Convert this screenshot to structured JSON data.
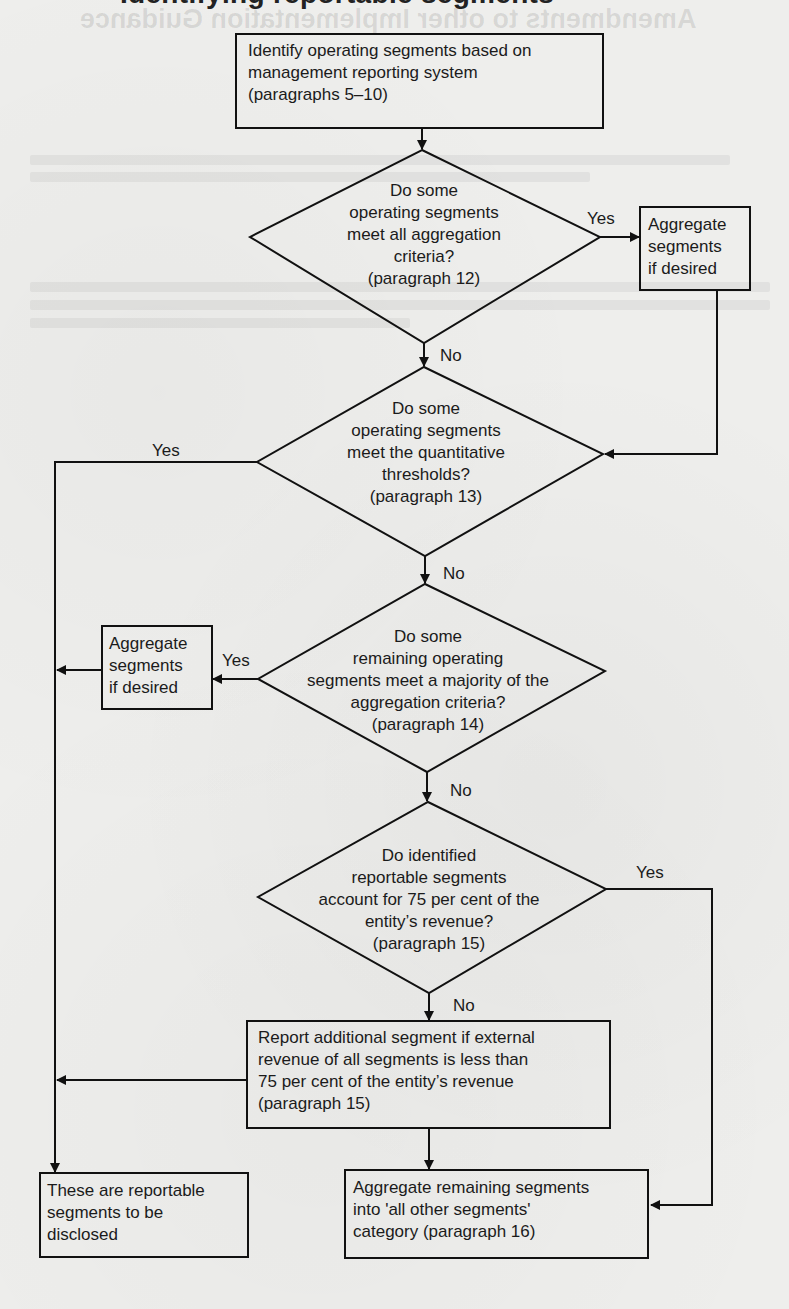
{
  "page": {
    "cut_heading": "Identifying reportable segments",
    "ghost_heading": "Amendments to other Implementation Guidance"
  },
  "flowchart": {
    "start": {
      "lines": [
        "Identify operating segments based on",
        "management reporting system",
        "(paragraphs 5–10)"
      ]
    },
    "decisions": [
      {
        "id": "d1",
        "lines": [
          "Do some",
          "operating segments",
          "meet all aggregation",
          "criteria?",
          "(paragraph 12)"
        ],
        "yes_label": "Yes",
        "no_label": "No"
      },
      {
        "id": "d2",
        "lines": [
          "Do some",
          "operating segments",
          "meet the quantitative",
          "thresholds?",
          "(paragraph 13)"
        ],
        "yes_label": "Yes",
        "no_label": "No"
      },
      {
        "id": "d3",
        "lines": [
          "Do some",
          "remaining operating",
          "segments meet a majority of the",
          "aggregation criteria?",
          "(paragraph 14)"
        ],
        "yes_label": "Yes",
        "no_label": "No"
      },
      {
        "id": "d4",
        "lines": [
          "Do identified",
          "reportable segments",
          "account for 75 per cent of the",
          "entity’s revenue?",
          "(paragraph 15)"
        ],
        "yes_label": "Yes",
        "no_label": "No"
      }
    ],
    "aggregate_right": {
      "lines": [
        "Aggregate",
        "segments",
        "if desired"
      ]
    },
    "aggregate_left": {
      "lines": [
        "Aggregate",
        "segments",
        "if desired"
      ]
    },
    "report_additional": {
      "lines": [
        "Report additional segment if external",
        "revenue of all segments is less than",
        "75 per cent of the entity’s revenue",
        "(paragraph 15)"
      ]
    },
    "reportable": {
      "lines": [
        "These are reportable",
        "segments to be",
        "disclosed"
      ]
    },
    "all_other": {
      "lines": [
        "Aggregate remaining segments",
        "into 'all other segments'",
        "category (paragraph 16)"
      ]
    }
  }
}
